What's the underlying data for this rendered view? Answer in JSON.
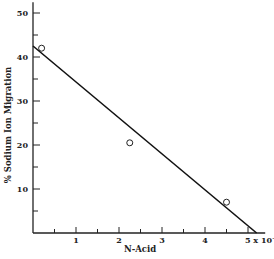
{
  "chart_data": {
    "type": "scatter",
    "title": "",
    "xlabel": "N-Acid",
    "ylabel": "% Sodium Ion Migration",
    "x_tick_labels": [
      "1",
      "2",
      "3",
      "4",
      "5 x 10⁻⁴"
    ],
    "x_ticks": [
      1,
      2,
      3,
      4,
      5
    ],
    "x_minor_ticks": [
      0.5,
      1.5,
      2.5,
      3.5,
      4.5
    ],
    "y_ticks": [
      10,
      20,
      30,
      40,
      50
    ],
    "y_minor_ticks": [
      5,
      15,
      25,
      35,
      45
    ],
    "xlim": [
      0,
      5.4
    ],
    "ylim": [
      0,
      52
    ],
    "grid": false,
    "series": [
      {
        "name": "measured",
        "marker": "open-circle",
        "points": [
          {
            "x": 0.2,
            "y": 42
          },
          {
            "x": 2.25,
            "y": 20.5
          },
          {
            "x": 4.5,
            "y": 7
          }
        ]
      },
      {
        "name": "fit line",
        "marker": "line",
        "points": [
          {
            "x": 0,
            "y": 42.5
          },
          {
            "x": 5.2,
            "y": 0
          }
        ]
      }
    ]
  }
}
